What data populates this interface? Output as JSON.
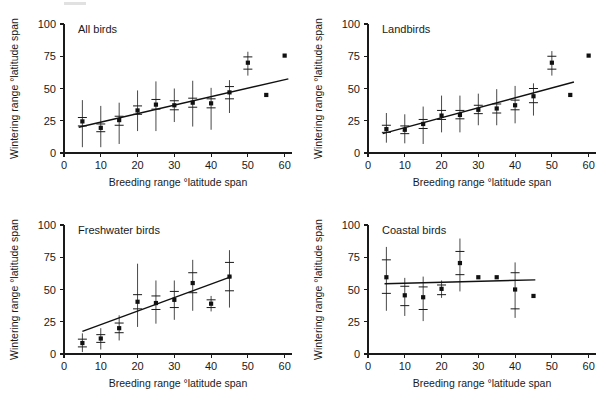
{
  "figure": {
    "panel_count": 4,
    "layout": "2x2"
  },
  "axes": {
    "xlabel": "Breeding range °latitude span",
    "ylabel": "Wintering range °latitude span",
    "xticks": [
      0,
      10,
      20,
      30,
      40,
      50,
      60
    ],
    "yticks": [
      0,
      25,
      50,
      75,
      100
    ],
    "xlim": [
      0,
      62
    ],
    "ylim": [
      0,
      100
    ],
    "xtick_labels": [
      "0",
      "10",
      "20",
      "30",
      "40",
      "50",
      "60"
    ],
    "ytick_labels": [
      "0",
      "25",
      "50",
      "75",
      "100"
    ]
  },
  "colors": {
    "marker": "#111111",
    "line": "#111111",
    "axis": "#1a1a1a",
    "background": "#ffffff"
  },
  "chart_data": [
    {
      "type": "scatter",
      "title": "All birds",
      "xlabel": "Breeding range °latitude span",
      "ylabel": "Wintering range °latitude span",
      "xlim": [
        0,
        62
      ],
      "ylim": [
        0,
        100
      ],
      "grid": false,
      "legend": "none",
      "x": [
        5,
        10,
        15,
        20,
        25,
        30,
        35,
        40,
        45,
        50,
        55,
        60
      ],
      "y": [
        24.5,
        19.5,
        25.5,
        33,
        37.5,
        37,
        39,
        38.5,
        47,
        70,
        45,
        75.5
      ],
      "ci_low": [
        21,
        16.5,
        21.5,
        30,
        34,
        33.5,
        35.5,
        35,
        42,
        65,
        null,
        null
      ],
      "ci_high": [
        27.5,
        22.5,
        28.5,
        36.5,
        41.5,
        40.5,
        42.5,
        42,
        51.5,
        74.5,
        null,
        null
      ],
      "range_low": [
        4.5,
        4.5,
        7,
        17,
        17,
        24,
        20.5,
        18,
        31,
        60,
        null,
        null
      ],
      "range_high": [
        41,
        36.5,
        39,
        48.5,
        55.5,
        50,
        56,
        50.5,
        56.5,
        78.5,
        null,
        null
      ],
      "fit_line": {
        "x0": 4,
        "y0": 20,
        "x1": 61,
        "y1": 57.5
      }
    },
    {
      "type": "scatter",
      "title": "Landbirds",
      "xlabel": "Breeding range °latitude span",
      "ylabel": "Wintering range °latitude span",
      "xlim": [
        0,
        62
      ],
      "ylim": [
        0,
        100
      ],
      "grid": false,
      "legend": "none",
      "x": [
        5,
        10,
        15,
        20,
        25,
        30,
        35,
        40,
        45,
        50,
        55,
        60
      ],
      "y": [
        18.5,
        18,
        22.5,
        29,
        29.5,
        33.5,
        34.5,
        37,
        44,
        70,
        45,
        75.5
      ],
      "ci_low": [
        16,
        15,
        19,
        26,
        26.5,
        30.5,
        31,
        33.5,
        39,
        65,
        null,
        null
      ],
      "ci_high": [
        21.5,
        21,
        26,
        33,
        33,
        37,
        38,
        41,
        50,
        75,
        null,
        null
      ],
      "range_low": [
        8,
        7.5,
        7,
        16,
        16,
        21.5,
        21.5,
        23,
        29,
        60,
        null,
        null
      ],
      "range_high": [
        31,
        30,
        36,
        44.5,
        44.5,
        46,
        49.5,
        52,
        54,
        79,
        null,
        null
      ],
      "fit_line": {
        "x0": 4,
        "y0": 15,
        "x1": 56,
        "y1": 55
      }
    },
    {
      "type": "scatter",
      "title": "Freshwater birds",
      "xlabel": "Breeding range °latitude span",
      "ylabel": "Wintering range °latitude span",
      "xlim": [
        0,
        62
      ],
      "ylim": [
        0,
        100
      ],
      "grid": false,
      "legend": "none",
      "x": [
        5,
        10,
        15,
        20,
        25,
        30,
        35,
        40,
        45
      ],
      "y": [
        8.5,
        12,
        20,
        40.5,
        39.5,
        42,
        55,
        39,
        60
      ],
      "ci_low": [
        5.5,
        9,
        16.5,
        35,
        34.5,
        36,
        47.5,
        36,
        49
      ],
      "ci_high": [
        11.5,
        15,
        24,
        46,
        45,
        48.5,
        63,
        42,
        71
      ],
      "range_low": [
        1.5,
        3.5,
        10.5,
        21,
        23.5,
        26.5,
        33.5,
        33,
        36
      ],
      "range_high": [
        16,
        20,
        30,
        70,
        57,
        57,
        73,
        45,
        80.5
      ],
      "fit_line": {
        "x0": 5,
        "y0": 17.5,
        "x1": 45.5,
        "y1": 60
      }
    },
    {
      "type": "scatter",
      "title": "Coastal birds",
      "xlabel": "Breeding range °latitude span",
      "ylabel": "Wintering range °latitude span",
      "xlim": [
        0,
        62
      ],
      "ylim": [
        0,
        100
      ],
      "grid": false,
      "legend": "none",
      "x": [
        5,
        10,
        15,
        20,
        25,
        30,
        35,
        40,
        45
      ],
      "y": [
        59.5,
        45.5,
        44,
        50.5,
        70.5,
        59.5,
        59.5,
        50,
        45
      ],
      "ci_low": [
        47,
        37.5,
        34.5,
        46,
        61.5,
        null,
        null,
        35,
        null
      ],
      "ci_high": [
        73,
        52.5,
        52,
        53.5,
        79.5,
        null,
        null,
        63,
        null
      ],
      "range_low": [
        33.5,
        29.5,
        25.5,
        43.5,
        48.5,
        null,
        null,
        28,
        null
      ],
      "range_high": [
        83,
        59,
        60,
        57,
        89.5,
        null,
        null,
        71,
        null
      ],
      "fit_line": {
        "x0": 4.5,
        "y0": 54.5,
        "x1": 45.5,
        "y1": 57.5
      }
    }
  ]
}
